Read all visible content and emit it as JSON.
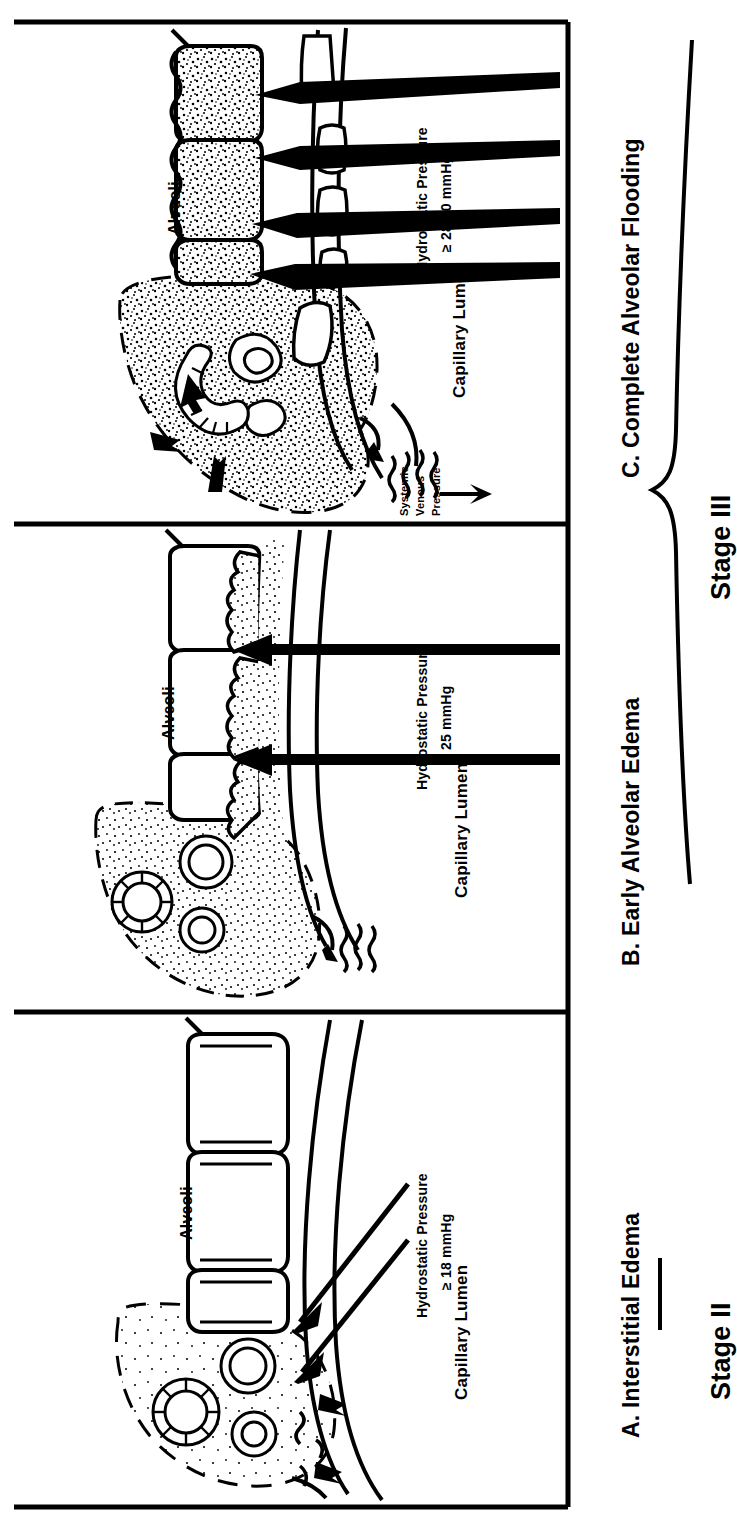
{
  "figure": {
    "orientation": "rotated-90-counterclockwise",
    "background": "#ffffff",
    "ink": "#000000",
    "panel_count": 3
  },
  "panels": [
    {
      "id": "panel-c",
      "letter_label": "C. Complete Alveolar Flooding",
      "alveoli_label": "Alveoli",
      "capillary_label": "Capillary Lumen",
      "pressure_label_line1": "Hydrostatic Pressure",
      "pressure_label_line2": "≥ 28-30 mmHg",
      "venous_label_line1": "Systemic",
      "venous_label_line2": "Venous",
      "venous_label_line3": "Pressure",
      "arrow_count": 4,
      "arrow_style": "thick-tapered",
      "alveoli_fill": "fully-stippled",
      "interstitium_fill": "heavily-stippled"
    },
    {
      "id": "panel-b",
      "letter_label": "B. Early Alveolar Edema",
      "alveoli_label": "Alveoli",
      "capillary_label": "Capillary Lumen",
      "pressure_label_line1": "Hydrostatic Pressure",
      "pressure_label_line2": "≥ 25 mmHg",
      "arrow_count": 2,
      "arrow_style": "thin-solid",
      "alveoli_fill": "partially-stippled",
      "interstitium_fill": "stippled"
    },
    {
      "id": "panel-a",
      "letter_label": "A. Interstitial Edema",
      "alveoli_label": "Alveoli",
      "capillary_label": "Capillary Lumen",
      "pressure_label_line1": "Hydrostatic Pressure",
      "pressure_label_line2": "≥ 18 mmHg",
      "arrow_count": 2,
      "arrow_style": "thin-diagonal",
      "alveoli_fill": "empty",
      "interstitium_fill": "sparse-dots"
    }
  ],
  "stages": [
    {
      "id": "stage-iii",
      "label": "Stage III",
      "bracket": "brace",
      "covers": [
        "panel-b",
        "panel-c"
      ]
    },
    {
      "id": "stage-ii",
      "label": "Stage II",
      "bracket": "line",
      "covers": [
        "panel-a"
      ]
    }
  ]
}
